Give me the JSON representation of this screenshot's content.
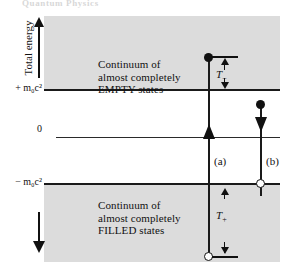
{
  "figure": {
    "top_caption": "Quantum Physics",
    "axis": {
      "y_label": "Total energy",
      "up_arrow_icon": "arrow-up-icon",
      "down_arrow_icon": "arrow-down-icon"
    },
    "ticks": {
      "positive_rest_energy": "+ m₀c²",
      "zero": "0",
      "negative_rest_energy": "− m₀c²"
    },
    "bands": {
      "empty": {
        "line1": "Continuum of",
        "line2": "almost completely",
        "line3": "EMPTY states"
      },
      "filled": {
        "line1": "Continuum of",
        "line2": "almost completely",
        "line3": "FILLED states"
      }
    },
    "transitions": [
      {
        "id": "a",
        "label": "(a)",
        "direction": "up",
        "start_marker": "open-circle",
        "end_marker": "filled-circle",
        "energy_label": "T−"
      },
      {
        "id": "b",
        "label": "(b)",
        "direction": "down",
        "start_marker": "filled-circle",
        "end_marker": "open-circle",
        "energy_label": "T+"
      }
    ],
    "energy_labels": {
      "kinetic_minus": "T",
      "kinetic_minus_sub": "−",
      "kinetic_plus": "T",
      "kinetic_plus_sub": "+"
    },
    "colors": {
      "band_fill": "#dcdcdc",
      "line": "#1a1a1a",
      "background": "#ffffff"
    }
  },
  "chart_data": {
    "type": "diagram",
    "ylabel": "Total energy",
    "levels": [
      {
        "name": "+ m₀c²",
        "value": 1,
        "tick": "+ m₀c²"
      },
      {
        "name": "0",
        "value": 0,
        "tick": "0"
      },
      {
        "name": "− m₀c²",
        "value": -1,
        "tick": "− m₀c²"
      }
    ],
    "regions": [
      {
        "name": "EMPTY continuum",
        "range": [
          1,
          2
        ],
        "fill": "#dcdcdc",
        "text": "Continuum of almost completely EMPTY states"
      },
      {
        "name": "forbidden gap",
        "range": [
          -1,
          1
        ],
        "fill": "#ffffff",
        "text": ""
      },
      {
        "name": "FILLED continuum",
        "range": [
          -2,
          -1
        ],
        "fill": "#dcdcdc",
        "text": "Continuum of almost completely FILLED states"
      }
    ],
    "series": [
      {
        "name": "(a)",
        "direction": "up",
        "from": -1.75,
        "to": 1.55,
        "from_marker": "open-circle",
        "to_marker": "filled-circle",
        "energy_gap_label": "T−"
      },
      {
        "name": "(b)",
        "direction": "down",
        "from": 1.0,
        "to": -1.0,
        "from_marker": "filled-circle",
        "to_marker": "open-circle",
        "energy_gap_label": "T+"
      }
    ],
    "grid": false,
    "legend": "none"
  }
}
